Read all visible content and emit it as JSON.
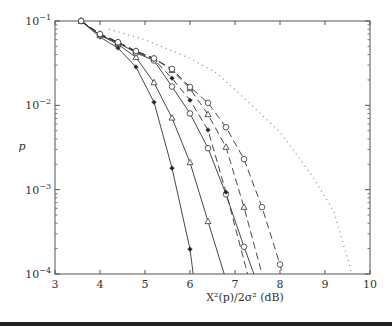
{
  "chart_data": {
    "type": "line",
    "title": "",
    "xlabel": "X²(p)/2σ² (dB)",
    "ylabel": "p",
    "xlim": [
      3,
      10
    ],
    "ylim": [
      0.0001,
      0.1
    ],
    "yscale": "log",
    "grid": false,
    "legend": "none",
    "x_ticks": [
      "3",
      "4",
      "5",
      "6",
      "7",
      "8",
      "9",
      "10"
    ],
    "y_ticks": [
      {
        "base": "10",
        "exp": "−1",
        "value": 0.1
      },
      {
        "base": "10",
        "exp": "−2",
        "value": 0.01
      },
      {
        "base": "10",
        "exp": "−3",
        "value": 0.001
      },
      {
        "base": "10",
        "exp": "−4",
        "value": 0.0001
      }
    ],
    "series": [
      {
        "name": "solid-star",
        "style": "solid",
        "marker": "star",
        "x": [
          3.58,
          4.0,
          4.4,
          4.8,
          5.2,
          5.6,
          6.0,
          6.07
        ],
        "y": [
          0.1,
          0.0645,
          0.0478,
          0.0285,
          0.0109,
          0.0018,
          0.000197,
          0.0001
        ],
        "markers_at": [
          0,
          1,
          2,
          3,
          4,
          5,
          6
        ]
      },
      {
        "name": "solid-triangle",
        "style": "solid",
        "marker": "triangle",
        "x": [
          3.58,
          4.0,
          4.4,
          4.8,
          5.2,
          5.6,
          6.0,
          6.4,
          6.76
        ],
        "y": [
          0.1,
          0.068,
          0.053,
          0.037,
          0.0186,
          0.0071,
          0.0021,
          0.00042,
          0.0001
        ],
        "markers_at": [
          0,
          1,
          2,
          3,
          4,
          5,
          6,
          7
        ]
      },
      {
        "name": "solid-circle",
        "style": "solid",
        "marker": "circle",
        "x": [
          3.58,
          4.0,
          4.4,
          4.8,
          5.2,
          5.6,
          6.0,
          6.4,
          6.8,
          7.2,
          7.42
        ],
        "y": [
          0.1,
          0.068,
          0.055,
          0.042,
          0.034,
          0.0167,
          0.008,
          0.0031,
          0.00088,
          0.00021,
          0.0001
        ],
        "markers_at": [
          0,
          1,
          2,
          3,
          4,
          5,
          6,
          7,
          8,
          9
        ]
      },
      {
        "name": "dashed-star",
        "style": "dashed",
        "marker": "star",
        "x": [
          3.58,
          4.0,
          4.4,
          4.8,
          5.2,
          5.6,
          6.0,
          6.4,
          6.8,
          7.28
        ],
        "y": [
          0.1,
          0.07,
          0.056,
          0.043,
          0.035,
          0.021,
          0.0115,
          0.0051,
          0.00093,
          0.0001
        ],
        "markers_at": [
          0,
          1,
          2,
          3,
          4,
          5,
          6,
          7,
          8
        ]
      },
      {
        "name": "dashed-triangle",
        "style": "dashed",
        "marker": "triangle",
        "x": [
          3.58,
          4.0,
          4.4,
          4.8,
          5.2,
          5.6,
          6.0,
          6.4,
          6.8,
          7.2,
          7.6
        ],
        "y": [
          0.1,
          0.07,
          0.056,
          0.044,
          0.036,
          0.026,
          0.0158,
          0.0078,
          0.0032,
          0.00062,
          0.0001
        ],
        "markers_at": [
          0,
          1,
          2,
          3,
          4,
          5,
          6,
          7,
          8,
          9
        ]
      },
      {
        "name": "dashed-circle",
        "style": "dashed",
        "marker": "circle",
        "x": [
          3.58,
          4.0,
          4.4,
          4.8,
          5.2,
          5.6,
          6.0,
          6.4,
          6.8,
          7.2,
          7.6,
          8.0,
          8.05
        ],
        "y": [
          0.1,
          0.07,
          0.056,
          0.044,
          0.036,
          0.027,
          0.0165,
          0.0107,
          0.0055,
          0.0023,
          0.00062,
          0.00013,
          0.0001
        ],
        "markers_at": [
          0,
          1,
          2,
          3,
          4,
          5,
          6,
          7,
          8,
          9,
          10,
          11
        ]
      },
      {
        "name": "dotted-reference",
        "style": "dotted",
        "marker": "none",
        "x": [
          4.2,
          5.0,
          6.0,
          6.6,
          7.3,
          8.0,
          8.7,
          9.2,
          9.6
        ],
        "y": [
          0.08,
          0.06,
          0.036,
          0.024,
          0.0109,
          0.0048,
          0.0015,
          0.00055,
          0.0001
        ],
        "markers_at": []
      }
    ]
  }
}
